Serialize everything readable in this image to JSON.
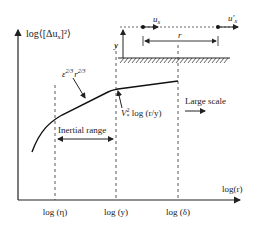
{
  "diagram": {
    "y_axis_label": "log⟨[Δu",
    "y_axis_sub": "x",
    "y_axis_tail": "]²⟩",
    "x_axis_label": "log(r)",
    "curve_annotation_top": "ε^{2/3} r^{2/3}",
    "curve_annotation_top_eps": "ε",
    "curve_annotation_top_exp1": "2/3",
    "curve_annotation_top_r": "r",
    "curve_annotation_top_exp2": "2/3",
    "curve_annotation_log": "V",
    "curve_annotation_log_sup": "2",
    "curve_annotation_log_sub": "*",
    "curve_annotation_log_tail": " log (r/y)",
    "inertial_range_label": "Inertial range",
    "large_scale_label": "Large scale",
    "x_ticks": [
      "log (η)",
      "log (y)",
      "log (δ)"
    ],
    "inset": {
      "ux_label": "u",
      "ux_sub": "x",
      "uxp_label": "u′",
      "uxp_sub": "x",
      "r_label": "r",
      "y_label": "y"
    }
  }
}
